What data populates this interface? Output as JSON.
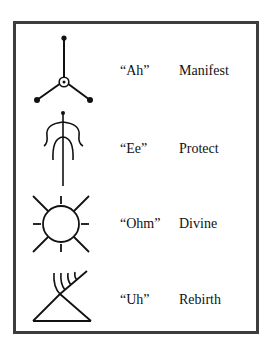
{
  "chart": {
    "rows": [
      {
        "symbol": "three-branch-node-icon",
        "sound": "“Ah”",
        "meaning": "Manifest"
      },
      {
        "symbol": "figure-with-arms-icon",
        "sound": "“Ee”",
        "meaning": "Protect"
      },
      {
        "symbol": "sun-rays-icon",
        "sound": "“Ohm”",
        "meaning": "Divine"
      },
      {
        "symbol": "triangle-branch-icon",
        "sound": "“Uh”",
        "meaning": "Rebirth"
      }
    ]
  },
  "colors": {
    "border": "#3d3d3d",
    "ink": "#111111"
  }
}
